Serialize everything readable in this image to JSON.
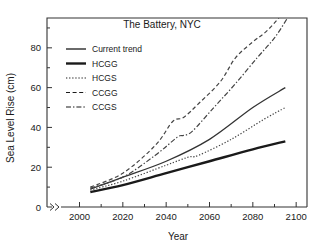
{
  "chart_data": {
    "type": "line",
    "title": "The Battery, NYC",
    "xlabel": "Year",
    "ylabel": "Sea Level Rise (cm)",
    "xlim": [
      1985,
      2105
    ],
    "ylim": [
      0,
      95
    ],
    "xticks": [
      2000,
      2020,
      2040,
      2060,
      2080,
      2100
    ],
    "yticks": [
      0,
      20,
      40,
      60,
      80
    ],
    "xtick_labels": [
      "2000",
      "2020",
      "2040",
      "2060",
      "2080",
      "2100"
    ],
    "ytick_labels": [
      "0",
      "20",
      "40",
      "60",
      "80"
    ],
    "grid": false,
    "axis_break": ">>",
    "legend_position": "upper-left-inside",
    "series": [
      {
        "name": "Current trend",
        "style": "solid-thin",
        "color": "#333333",
        "x": [
          2005,
          2020,
          2040,
          2060,
          2080,
          2095
        ],
        "y": [
          9,
          15,
          23,
          34,
          50,
          60
        ]
      },
      {
        "name": "HCGG",
        "style": "solid-thick",
        "color": "#1a1a1a",
        "x": [
          2005,
          2020,
          2040,
          2060,
          2080,
          2095
        ],
        "y": [
          7.5,
          11,
          17,
          23,
          29,
          33
        ]
      },
      {
        "name": "HCGS",
        "style": "dotted",
        "color": "#444444",
        "x": [
          2005,
          2020,
          2040,
          2050,
          2055,
          2070,
          2085,
          2095
        ],
        "y": [
          8.5,
          13,
          21,
          25,
          26,
          34,
          44,
          50
        ]
      },
      {
        "name": "CCGG",
        "style": "dashed",
        "color": "#444444",
        "x": [
          2005,
          2020,
          2035,
          2043,
          2048,
          2055,
          2065,
          2072,
          2080,
          2086,
          2092
        ],
        "y": [
          10,
          17,
          31,
          43,
          45,
          52,
          63,
          75,
          83,
          88,
          95
        ]
      },
      {
        "name": "CCGS",
        "style": "dash-dot",
        "color": "#444444",
        "x": [
          2005,
          2020,
          2035,
          2045,
          2048,
          2052,
          2062,
          2072,
          2082,
          2090,
          2096
        ],
        "y": [
          9.5,
          15,
          26,
          35,
          36,
          38,
          50,
          62,
          75,
          85,
          95
        ]
      }
    ],
    "legend_entries": [
      {
        "label": "Current trend",
        "style": "solid-thin"
      },
      {
        "label": "HCGG",
        "style": "solid-thick"
      },
      {
        "label": "HCGS",
        "style": "dotted"
      },
      {
        "label": "CCGG",
        "style": "dashed"
      },
      {
        "label": "CCGS",
        "style": "dash-dot"
      }
    ]
  }
}
